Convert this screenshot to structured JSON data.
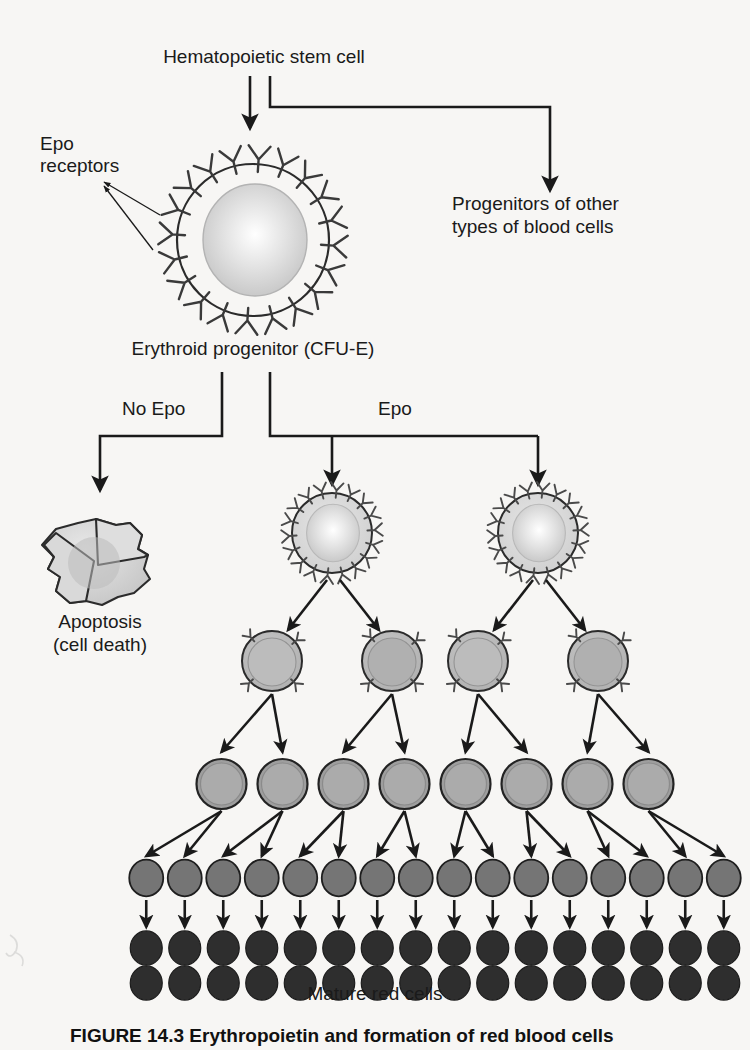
{
  "figure": {
    "title_caption": "FIGURE 14.3  Erythropoietin and formation of red blood cells",
    "background_color": "#f7f6f4",
    "ink_color": "#1a1a1a"
  },
  "labels": {
    "stem_cell": "Hematopoietic stem cell",
    "epo_receptors": "Epo\nreceptors",
    "epo_receptors_line1": "Epo",
    "epo_receptors_line2": "receptors",
    "progenitors_line1": "Progenitors of other",
    "progenitors_line2": "types of blood cells",
    "erythroid_progenitor": "Erythroid progenitor (CFU-E)",
    "no_epo": "No Epo",
    "epo": "Epo",
    "apoptosis_line1": "Apoptosis",
    "apoptosis_line2": "(cell death)",
    "mature_red_cells": "Mature red cells"
  },
  "cell_rows": [
    {
      "name": "erythroid-progenitor-cell",
      "count": 1,
      "radius": 77,
      "receptors": 20,
      "fill": "#d9d9d9",
      "nucleus_fill": "#cfcfcf",
      "has_nucleus": true,
      "stage": "CFU-E"
    },
    {
      "name": "epo-stimulated-cell",
      "count": 2,
      "radius": 40,
      "receptors": 18,
      "fill": "#d6d6d6",
      "nucleus_fill": "#cacaca",
      "has_nucleus": true,
      "stage": "proerythroblast"
    },
    {
      "name": "dividing-erythroblast",
      "count": 4,
      "radius": 30,
      "receptors": 4,
      "fill": "#b5b5b5",
      "nucleus_fill": "#b0b0b0",
      "has_nucleus": true,
      "stage": "erythroblast"
    },
    {
      "name": "erythroblast-row",
      "count": 8,
      "radius": 25,
      "receptors": 0,
      "fill": "#a8a8a8",
      "nucleus_fill": "#a8a8a8",
      "has_nucleus": true,
      "stage": "late erythroblast"
    },
    {
      "name": "reticulocyte-row",
      "count": 16,
      "radius": 17,
      "receptors": 0,
      "fill": "#7d7d7d",
      "nucleus_fill": "#7d7d7d",
      "has_nucleus": false,
      "stage": "reticulocyte"
    },
    {
      "name": "mature-red-cell-row-1",
      "count": 16,
      "radius": 16,
      "receptors": 0,
      "fill": "#2e2e2e",
      "nucleus_fill": "#2e2e2e",
      "has_nucleus": false,
      "stage": "mature red cell"
    },
    {
      "name": "mature-red-cell-row-2",
      "count": 16,
      "radius": 16,
      "receptors": 0,
      "fill": "#2e2e2e",
      "nucleus_fill": "#2e2e2e",
      "has_nucleus": false,
      "stage": "mature red cell"
    }
  ],
  "apoptosis_cell": {
    "name": "apoptotic-cell-fragments",
    "fragments": 3,
    "fill": "#d4d4d4",
    "stroke": "#2b2b2b"
  },
  "flow": {
    "branches": [
      {
        "from": "hematopoietic-stem-cell",
        "to": "erythroid-progenitor",
        "label": ""
      },
      {
        "from": "hematopoietic-stem-cell",
        "to": "progenitors-of-other-blood-cells",
        "label": ""
      },
      {
        "from": "erythroid-progenitor",
        "to": "apoptosis",
        "label": "No Epo"
      },
      {
        "from": "erythroid-progenitor",
        "to": "epo-stimulated-cells",
        "label": "Epo"
      }
    ]
  }
}
